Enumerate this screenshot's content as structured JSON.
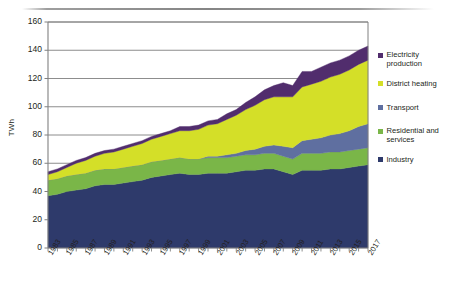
{
  "chart_data": {
    "type": "area",
    "stacked": true,
    "title": "",
    "xlabel": "",
    "ylabel": "TWh",
    "ylim": [
      0,
      160
    ],
    "ytick_step": 20,
    "yticks": [
      0,
      20,
      40,
      60,
      80,
      100,
      120,
      140,
      160
    ],
    "grid": true,
    "legend_position": "right",
    "x": [
      1983,
      1984,
      1985,
      1986,
      1987,
      1988,
      1989,
      1990,
      1991,
      1992,
      1993,
      1994,
      1995,
      1996,
      1997,
      1998,
      1999,
      2000,
      2001,
      2002,
      2003,
      2004,
      2005,
      2006,
      2007,
      2008,
      2009,
      2010,
      2011,
      2012,
      2013,
      2014,
      2015,
      2016,
      2017
    ],
    "xtick_labels": [
      "1983",
      "1985",
      "1987",
      "1989",
      "1991",
      "1993",
      "1995",
      "1997",
      "1999",
      "2001",
      "2003",
      "2005",
      "2007",
      "2009",
      "2011",
      "2013",
      "2015",
      "2017"
    ],
    "series": [
      {
        "name": "Industry",
        "color": "#2e3a6b",
        "values": [
          37,
          38,
          40,
          41,
          42,
          44,
          45,
          45,
          46,
          47,
          48,
          50,
          51,
          52,
          53,
          52,
          52,
          53,
          53,
          53,
          54,
          55,
          55,
          56,
          56,
          54,
          52,
          55,
          55,
          55,
          56,
          56,
          57,
          58,
          59
        ]
      },
      {
        "name": "Residential and services",
        "color": "#7ab648",
        "values": [
          11,
          11,
          11,
          11,
          11,
          11,
          11,
          11,
          11,
          11,
          11,
          11,
          11,
          11,
          11,
          11,
          11,
          11,
          11,
          11,
          11,
          11,
          11,
          11,
          11,
          11,
          11,
          12,
          12,
          12,
          12,
          12,
          12,
          12,
          12
        ]
      },
      {
        "name": "Transport",
        "color": "#5f6fa0",
        "values": [
          0,
          0,
          0,
          0,
          0,
          0,
          0,
          0,
          0,
          0,
          0,
          0,
          0,
          0,
          0,
          0,
          0,
          1,
          1,
          2,
          2,
          3,
          4,
          5,
          6,
          7,
          8,
          9,
          10,
          11,
          12,
          13,
          14,
          16,
          17
        ]
      },
      {
        "name": "District heating",
        "color": "#d4df28",
        "values": [
          4,
          5,
          6,
          8,
          9,
          10,
          11,
          12,
          13,
          14,
          15,
          16,
          17,
          18,
          19,
          20,
          21,
          22,
          23,
          25,
          27,
          29,
          31,
          33,
          34,
          35,
          36,
          38,
          39,
          40,
          41,
          42,
          43,
          44,
          45
        ]
      },
      {
        "name": "Electricity production",
        "color": "#512d6d",
        "values": [
          2,
          2,
          2,
          2,
          2,
          2,
          2,
          2,
          2,
          2,
          2,
          2,
          2,
          2,
          3,
          3,
          3,
          3,
          3,
          4,
          4,
          5,
          6,
          7,
          8,
          10,
          8,
          11,
          9,
          10,
          10,
          10,
          10,
          10,
          10
        ]
      }
    ],
    "totals": [
      54,
      56,
      59,
      62,
      64,
      67,
      69,
      70,
      72,
      74,
      76,
      79,
      81,
      83,
      86,
      86,
      87,
      90,
      91,
      95,
      98,
      103,
      107,
      112,
      115,
      117,
      115,
      125,
      125,
      128,
      131,
      133,
      136,
      140,
      143
    ]
  },
  "legend": {
    "items": [
      {
        "label": "Electricity production",
        "color": "#512d6d"
      },
      {
        "label": "District heating",
        "color": "#d4df28"
      },
      {
        "label": "Transport",
        "color": "#5f6fa0"
      },
      {
        "label": "Residential and services",
        "color": "#7ab648"
      },
      {
        "label": "Industry",
        "color": "#2e3a6b"
      }
    ]
  },
  "axes": {
    "y_title": "TWh",
    "axis_color": "#808080",
    "grid_color": "#808080"
  }
}
